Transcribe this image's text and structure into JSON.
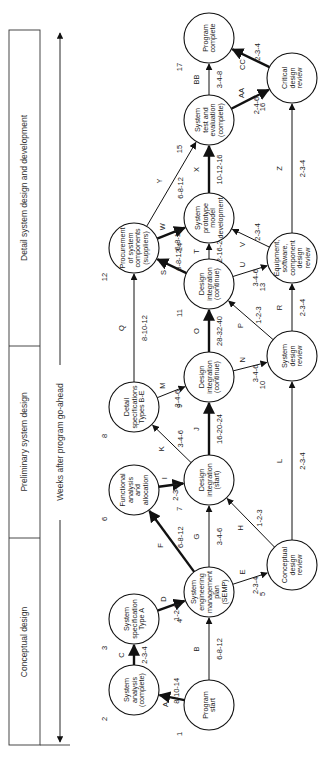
{
  "phases": [
    {
      "label": "Detail system design and development"
    },
    {
      "label": "Preliminary system design"
    },
    {
      "label": "Conceptual design"
    }
  ],
  "axis": {
    "label": "Weeks after program go-ahead"
  },
  "nodes": [
    {
      "id": "1",
      "lines": [
        "Program",
        "start"
      ]
    },
    {
      "id": "2",
      "lines": [
        "System",
        "analysis",
        "(complete)"
      ]
    },
    {
      "id": "3",
      "lines": [
        "System",
        "specification",
        "Type A"
      ]
    },
    {
      "id": "4",
      "lines": [
        "System",
        "engineering",
        "management",
        "plan",
        "(SEMP)"
      ]
    },
    {
      "id": "5",
      "lines": [
        "Conceptual",
        "design",
        "review"
      ]
    },
    {
      "id": "6",
      "lines": [
        "Functional",
        "analysis",
        "and",
        "allocation"
      ]
    },
    {
      "id": "7",
      "lines": [
        "Design",
        "integration",
        "(start)"
      ]
    },
    {
      "id": "8",
      "lines": [
        "Detail",
        "specifications",
        "Types B-E"
      ]
    },
    {
      "id": "9",
      "lines": [
        "Design",
        "integration",
        "(continue)"
      ]
    },
    {
      "id": "10",
      "lines": [
        "System",
        "design",
        "review"
      ]
    },
    {
      "id": "11",
      "lines": [
        "Design",
        "integration",
        "(continue)"
      ]
    },
    {
      "id": "12",
      "lines": [
        "Procurement",
        "of system",
        "components",
        "(suppliers)"
      ]
    },
    {
      "id": "13",
      "lines": [
        "Equipment,",
        "software,",
        "component",
        "design",
        "review"
      ]
    },
    {
      "id": "14",
      "lines": [
        "System",
        "prototype",
        "model",
        "development"
      ]
    },
    {
      "id": "15",
      "lines": [
        "System",
        "test and",
        "evaluation",
        "(complete)"
      ]
    },
    {
      "id": "16",
      "lines": [
        "Critical",
        "design",
        "review"
      ]
    },
    {
      "id": "17",
      "lines": [
        "Program",
        "complete"
      ]
    }
  ],
  "activities": [
    {
      "letter": "A",
      "time": "8-10-14",
      "from": "1",
      "to": "2"
    },
    {
      "letter": "B",
      "time": "6-8-12",
      "from": "1",
      "to": "4"
    },
    {
      "letter": "C",
      "time": "2-3-4",
      "from": "2",
      "to": "3"
    },
    {
      "letter": "D",
      "time": "1-2-3",
      "from": "3",
      "to": "4"
    },
    {
      "letter": "E",
      "time": "2-3-4",
      "from": "4",
      "to": "5"
    },
    {
      "letter": "F",
      "time": "6-8-12",
      "from": "4",
      "to": "6"
    },
    {
      "letter": "G",
      "time": "3-4-6",
      "from": "4",
      "to": "7"
    },
    {
      "letter": "H",
      "time": "1-2-3",
      "from": "5",
      "to": "7"
    },
    {
      "letter": "I",
      "time": "2-3-4",
      "from": "6",
      "to": "7"
    },
    {
      "letter": "J",
      "time": "16-20-24",
      "from": "7",
      "to": "9"
    },
    {
      "letter": "K",
      "time": "3-4-6",
      "from": "7",
      "to": "8"
    },
    {
      "letter": "L",
      "time": "2-3-4",
      "from": "5",
      "to": "10"
    },
    {
      "letter": "M",
      "time": "3-4-6",
      "from": "8",
      "to": "9"
    },
    {
      "letter": "N",
      "time": "3-4-6",
      "from": "9",
      "to": "10"
    },
    {
      "letter": "O",
      "time": "28-32-40",
      "from": "9",
      "to": "11"
    },
    {
      "letter": "P",
      "time": "1-2-3",
      "from": "10",
      "to": "11"
    },
    {
      "letter": "Q",
      "time": "8-10-12",
      "from": "8",
      "to": "12"
    },
    {
      "letter": "R",
      "time": "2-3-4",
      "from": "10",
      "to": "13"
    },
    {
      "letter": "S",
      "time": "6-8-12",
      "from": "11",
      "to": "12"
    },
    {
      "letter": "T",
      "time": "12-16-20",
      "from": "11",
      "to": "14"
    },
    {
      "letter": "U",
      "time": "3-4-6",
      "from": "11",
      "to": "13"
    },
    {
      "letter": "V",
      "time": "2-3-4",
      "from": "13",
      "to": "14"
    },
    {
      "letter": "W",
      "time": "6-8-12",
      "from": "12",
      "to": "14"
    },
    {
      "letter": "X",
      "time": "10-12-16",
      "from": "14",
      "to": "15"
    },
    {
      "letter": "Y",
      "time": "6-8-12",
      "from": "12",
      "to": "15"
    },
    {
      "letter": "Z",
      "time": "2-3-4",
      "from": "13",
      "to": "16"
    },
    {
      "letter": "AA",
      "time": "2-4-6",
      "from": "15",
      "to": "16"
    },
    {
      "letter": "BB",
      "time": "3-4-8",
      "from": "15",
      "to": "17"
    },
    {
      "letter": "CC",
      "time": "2-3-4",
      "from": "16",
      "to": "17"
    }
  ]
}
